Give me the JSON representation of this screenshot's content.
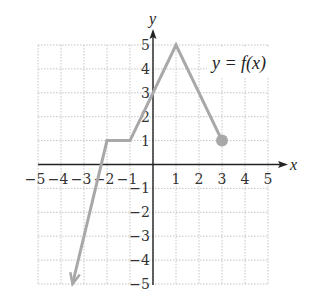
{
  "chart_data": {
    "type": "line",
    "title": "",
    "function_label": "y = f(x)",
    "xlabel": "x",
    "ylabel": "y",
    "xlim": [
      -5,
      5
    ],
    "ylim": [
      -5,
      5
    ],
    "x_ticks": [
      -5,
      -4,
      -3,
      -2,
      -1,
      1,
      2,
      3,
      4,
      5
    ],
    "y_ticks": [
      -5,
      -4,
      -3,
      -2,
      -1,
      1,
      2,
      3,
      4,
      5
    ],
    "grid": true,
    "series": [
      {
        "name": "f(x)",
        "points": [
          [
            -3.5,
            -5
          ],
          [
            -2,
            1
          ],
          [
            -1,
            1
          ],
          [
            0,
            3
          ],
          [
            1,
            5
          ],
          [
            3,
            1
          ]
        ],
        "start_marker": "arrow",
        "end_marker": "closed-dot",
        "color": "#a8a8a8"
      }
    ],
    "annotations": [
      {
        "text": "y = f(x)",
        "x": 3.5,
        "y": 4.2
      }
    ]
  },
  "colors": {
    "axis": "#222222",
    "grid": "#c4c4c4",
    "curve": "#a8a8a8",
    "background": "#ffffff"
  }
}
